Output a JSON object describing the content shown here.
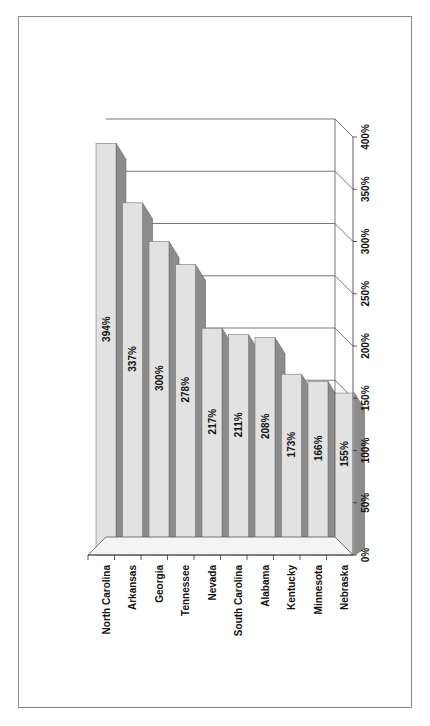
{
  "chart_data": {
    "type": "bar",
    "orientation": "vertical bars, figure rotated 90° on page (3D column chart)",
    "categories": [
      "North Carolina",
      "Arkansas",
      "Georgia",
      "Tennessee",
      "Nevada",
      "South Carolina",
      "Alabama",
      "Kentucky",
      "Minnesota",
      "Nebraska"
    ],
    "values": [
      394,
      337,
      300,
      278,
      217,
      211,
      208,
      173,
      166,
      155
    ],
    "data_labels": [
      "394%",
      "337%",
      "300%",
      "278%",
      "217%",
      "211%",
      "208%",
      "173%",
      "166%",
      "155%"
    ],
    "title": "",
    "xlabel": "",
    "ylabel": "",
    "ylim": [
      0,
      400
    ],
    "y_ticks": [
      "0%",
      "50%",
      "100%",
      "150%",
      "200%",
      "250%",
      "300%",
      "350%",
      "400%"
    ],
    "grid": true,
    "legend": null,
    "three_d": true
  },
  "colors": {
    "bar_front": "#e2e2e2",
    "bar_side": "#8c8c8c",
    "bar_top": "#c8c8c8",
    "gridline": "#555555",
    "frame": "#8a8a8a"
  }
}
